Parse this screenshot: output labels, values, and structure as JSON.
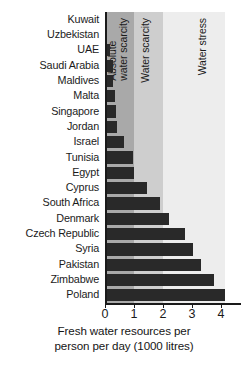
{
  "chart_data": {
    "type": "bar",
    "orientation": "horizontal",
    "title": "",
    "xlabel": "Fresh water resources per person per day (1000 litres)",
    "ylabel": "",
    "xlim": [
      0,
      4.14
    ],
    "xticks": [
      0,
      1,
      2,
      3,
      4
    ],
    "xtick_labels": [
      "0",
      "1",
      "2",
      "3",
      "4"
    ],
    "grid": false,
    "legend_position": "none",
    "bar_color": "#292929",
    "categories": [
      "Kuwait",
      "Uzbekistan",
      "UAE",
      "Saudi Arabia",
      "Maldives",
      "Malta",
      "Singapore",
      "Jordan",
      "Israel",
      "Tunisia",
      "Egypt",
      "Cyprus",
      "South Africa",
      "Denmark",
      "Czech Republic",
      "Syria",
      "Pakistan",
      "Zimbabwe",
      "Poland"
    ],
    "values": [
      0.03,
      0.05,
      0.17,
      0.28,
      0.29,
      0.35,
      0.39,
      0.4,
      0.66,
      0.96,
      1.0,
      1.45,
      1.9,
      2.2,
      2.75,
      3.05,
      3.3,
      3.75,
      4.14
    ],
    "bands": [
      {
        "name": "absolute-water-scarcity",
        "label": "Absolute\nwater scarcity",
        "x0": 0,
        "x1": 1,
        "color": "#a9a9a9"
      },
      {
        "name": "water-scarcity",
        "label": "Water scarcity",
        "x0": 1,
        "x1": 2,
        "color": "#cecece"
      },
      {
        "name": "water-stress",
        "label": "Water stress",
        "x0": 2,
        "x1": 4.14,
        "color": "#ededed"
      }
    ],
    "annotations": []
  },
  "axis": {
    "x_title_line1": "Fresh water resources per",
    "x_title_line2": "person per day (1000 litres)"
  }
}
